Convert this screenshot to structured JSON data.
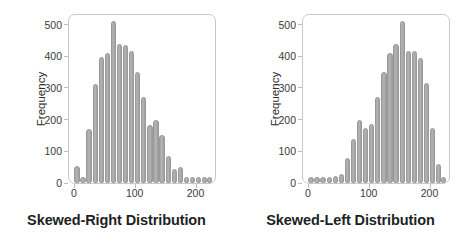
{
  "figure": {
    "axis_label_y": "Frequency",
    "bar_color": "#a9a9a9",
    "frame_color": "#c9c9c9",
    "text_color": "#231f20"
  },
  "chart_data": [
    {
      "type": "bar",
      "title": "Skewed-Right Distribution",
      "xlabel": "",
      "ylabel": "Frequency",
      "ylim": [
        0,
        530
      ],
      "xlim": [
        -8,
        232
      ],
      "grid": false,
      "legend": null,
      "ytick_labels": [
        "0",
        "100",
        "200",
        "300",
        "400",
        "500"
      ],
      "ytick_values": [
        0,
        100,
        200,
        300,
        400,
        500
      ],
      "xtick_labels": [
        "0",
        "100",
        "200"
      ],
      "xtick_values": [
        0,
        100,
        200
      ],
      "bar_width": 8,
      "x": [
        5,
        15,
        25,
        35,
        45,
        55,
        65,
        75,
        85,
        95,
        105,
        115,
        125,
        135,
        145,
        155,
        165,
        175,
        185,
        195,
        205,
        215,
        223
      ],
      "values": [
        55,
        8,
        170,
        312,
        396,
        410,
        510,
        440,
        435,
        415,
        350,
        270,
        182,
        200,
        150,
        85,
        45,
        50,
        18,
        10,
        10,
        10,
        10
      ]
    },
    {
      "type": "bar",
      "title": "Skewed-Left Distribution",
      "xlabel": "",
      "ylabel": "Frequency",
      "ylim": [
        0,
        530
      ],
      "xlim": [
        -8,
        232
      ],
      "grid": false,
      "legend": null,
      "ytick_labels": [
        "0",
        "100",
        "200",
        "300",
        "400",
        "500"
      ],
      "ytick_values": [
        0,
        100,
        200,
        300,
        400,
        500
      ],
      "xtick_labels": [
        "0",
        "100",
        "200"
      ],
      "xtick_values": [
        0,
        100,
        200
      ],
      "bar_width": 8,
      "x": [
        5,
        15,
        25,
        35,
        45,
        55,
        65,
        75,
        85,
        95,
        105,
        115,
        125,
        135,
        145,
        155,
        165,
        175,
        185,
        195,
        205,
        215,
        223
      ],
      "values": [
        10,
        10,
        10,
        12,
        22,
        30,
        80,
        140,
        200,
        175,
        185,
        270,
        350,
        410,
        440,
        510,
        418,
        415,
        395,
        315,
        172,
        60,
        0
      ]
    }
  ]
}
